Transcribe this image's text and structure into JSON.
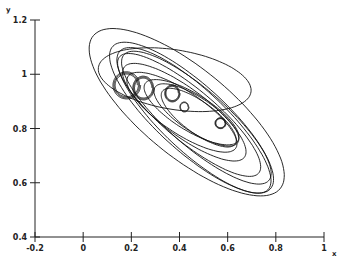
{
  "chart_data": {
    "type": "line",
    "title": "",
    "xlabel": "x",
    "ylabel": "y",
    "xlim": [
      -0.2,
      1.0
    ],
    "ylim": [
      0.4,
      1.2
    ],
    "xticks": [
      "-0.2",
      "0",
      "0.2",
      "0.4",
      "0.6",
      "0.8",
      "1"
    ],
    "xtick_values": [
      -0.2,
      0,
      0.2,
      0.4,
      0.6,
      0.8,
      1.0
    ],
    "yticks": [
      "0.4",
      "0.6",
      "0.8",
      "1",
      "1.2"
    ],
    "ytick_values": [
      0.4,
      0.6,
      0.8,
      1.0,
      1.2
    ],
    "grid": false,
    "legend": "none",
    "series": [
      {
        "name": "outer-orbit",
        "cx": 0.43,
        "cy": 0.86,
        "rx": 0.48,
        "ry": 0.17,
        "angle_deg": -35,
        "loops": 1
      },
      {
        "name": "cycle-1",
        "cx": 0.45,
        "cy": 0.84,
        "rx": 0.42,
        "ry": 0.13,
        "angle_deg": -38,
        "loops": 1
      },
      {
        "name": "cycle-2",
        "cx": 0.46,
        "cy": 0.83,
        "rx": 0.4,
        "ry": 0.12,
        "angle_deg": -39,
        "loops": 1
      },
      {
        "name": "cycle-3",
        "cx": 0.47,
        "cy": 0.84,
        "rx": 0.38,
        "ry": 0.11,
        "angle_deg": -37,
        "loops": 1
      },
      {
        "name": "cycle-4",
        "cx": 0.44,
        "cy": 0.85,
        "rx": 0.36,
        "ry": 0.1,
        "angle_deg": -36,
        "loops": 1
      },
      {
        "name": "cycle-5",
        "cx": 0.42,
        "cy": 0.86,
        "rx": 0.3,
        "ry": 0.09,
        "angle_deg": -33,
        "loops": 1
      },
      {
        "name": "cycle-6",
        "cx": 0.41,
        "cy": 0.86,
        "rx": 0.26,
        "ry": 0.08,
        "angle_deg": -30,
        "loops": 1
      },
      {
        "name": "inner-1",
        "cx": 0.45,
        "cy": 0.86,
        "rx": 0.22,
        "ry": 0.07,
        "angle_deg": -28,
        "loops": 1
      },
      {
        "name": "inner-2",
        "cx": 0.47,
        "cy": 0.85,
        "rx": 0.2,
        "ry": 0.065,
        "angle_deg": -30,
        "loops": 1
      },
      {
        "name": "inner-3",
        "cx": 0.48,
        "cy": 0.84,
        "rx": 0.18,
        "ry": 0.06,
        "angle_deg": -32,
        "loops": 1
      },
      {
        "name": "curl-a",
        "cx": 0.18,
        "cy": 0.96,
        "rx": 0.045,
        "ry": 0.04,
        "angle_deg": 0,
        "loops": 3
      },
      {
        "name": "curl-b",
        "cx": 0.25,
        "cy": 0.95,
        "rx": 0.035,
        "ry": 0.035,
        "angle_deg": 0,
        "loops": 3
      },
      {
        "name": "curl-c",
        "cx": 0.37,
        "cy": 0.93,
        "rx": 0.025,
        "ry": 0.025,
        "angle_deg": 0,
        "loops": 3
      },
      {
        "name": "curl-d",
        "cx": 0.42,
        "cy": 0.88,
        "rx": 0.015,
        "ry": 0.015,
        "angle_deg": 0,
        "loops": 2
      },
      {
        "name": "curl-e",
        "cx": 0.57,
        "cy": 0.82,
        "rx": 0.018,
        "ry": 0.016,
        "angle_deg": 0,
        "loops": 3
      },
      {
        "name": "start-arc",
        "cx": 0.38,
        "cy": 0.98,
        "rx": 0.32,
        "ry": 0.11,
        "angle_deg": -8,
        "loops": 1
      }
    ]
  }
}
